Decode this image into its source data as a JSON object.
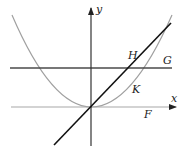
{
  "diagram": {
    "width": 182,
    "height": 154,
    "colors": {
      "axis": "#222222",
      "x_axis": "#999999",
      "parabola": "#999999",
      "line_G": "#444444",
      "line_diag": "#111111",
      "text": "#222222"
    },
    "axes": {
      "x_label": "x",
      "y_label": "y",
      "origin": [
        91,
        107
      ]
    },
    "curves": [
      {
        "id": "F",
        "label": "F",
        "type": "horizontal-line",
        "description": "x-axis line (y = 0)"
      },
      {
        "id": "G",
        "label": "G",
        "type": "horizontal-line",
        "description": "horizontal line above x-axis"
      },
      {
        "id": "H",
        "label": "H",
        "type": "line",
        "description": "straight line through origin"
      },
      {
        "id": "K",
        "label": "K",
        "type": "parabola",
        "description": "parabola with vertex at origin"
      }
    ],
    "labels": {
      "F": "F",
      "G": "G",
      "H": "H",
      "K": "K"
    }
  }
}
